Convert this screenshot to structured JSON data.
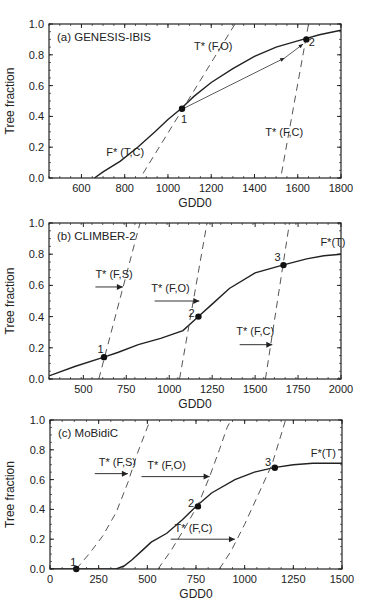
{
  "chart_data": [
    {
      "type": "line",
      "panel": "a",
      "title": "(a) GENESIS-IBIS",
      "xlabel": "GDD0",
      "ylabel": "Tree fraction",
      "xlim": [
        450,
        1800
      ],
      "ylim": [
        0.0,
        1.0
      ],
      "xticks": [
        600,
        800,
        1000,
        1200,
        1400,
        1600,
        1800
      ],
      "yticks": [
        0.0,
        0.2,
        0.4,
        0.6,
        0.8,
        1.0
      ],
      "frame": {
        "left": 49,
        "top": 24,
        "right": 341,
        "bottom": 178
      },
      "series": [
        {
          "name": "F* (T,C)",
          "style": "solid",
          "x": [
            660,
            700,
            780,
            860,
            940,
            1000,
            1060,
            1120,
            1200,
            1300,
            1400,
            1500,
            1600,
            1700,
            1800
          ],
          "y": [
            0.0,
            0.04,
            0.11,
            0.2,
            0.3,
            0.38,
            0.45,
            0.53,
            0.62,
            0.71,
            0.79,
            0.85,
            0.89,
            0.93,
            0.96
          ]
        },
        {
          "name": "T* (F,O)",
          "style": "dashed",
          "x": [
            885,
            1310
          ],
          "y": [
            0.03,
            1.0
          ]
        },
        {
          "name": "T* (F,C)",
          "style": "dashed",
          "x": [
            1525,
            1650
          ],
          "y": [
            0.03,
            1.0
          ]
        },
        {
          "name": "arrow",
          "style": "arrow",
          "x": [
            1070,
            1540
          ],
          "y": [
            0.45,
            0.78
          ]
        },
        {
          "name": "arrow2",
          "style": "arrow",
          "x": [
            1540,
            1625
          ],
          "y": [
            0.78,
            0.87
          ]
        }
      ],
      "points": [
        {
          "label": "1",
          "x": 1065,
          "y": 0.45,
          "lx": 1075,
          "ly": 0.38
        },
        {
          "label": "2",
          "x": 1640,
          "y": 0.9,
          "lx": 1665,
          "ly": 0.88
        }
      ],
      "annotations": [
        {
          "text": "T* (F,O)",
          "x": 1120,
          "y": 0.83
        },
        {
          "text": "T* (F,C)",
          "x": 1450,
          "y": 0.27
        },
        {
          "text": "F* (T,C)",
          "x": 715,
          "y": 0.14
        }
      ]
    },
    {
      "type": "line",
      "panel": "b",
      "title": "(b) CLIMBER-2",
      "xlabel": "GDD0",
      "ylabel": "Tree fraction",
      "xlim": [
        300,
        2000
      ],
      "ylim": [
        0.0,
        1.0
      ],
      "xticks": [
        500,
        750,
        1000,
        1250,
        1500,
        1750,
        2000
      ],
      "yticks": [
        0.0,
        0.2,
        0.4,
        0.6,
        0.8,
        1.0
      ],
      "frame": {
        "left": 49,
        "top": 223,
        "right": 341,
        "bottom": 379
      },
      "series": [
        {
          "name": "F*(T)",
          "style": "solid",
          "x": [
            300,
            450,
            620,
            700,
            820,
            950,
            1080,
            1170,
            1250,
            1350,
            1500,
            1660,
            1800,
            1900,
            2000
          ],
          "y": [
            0.02,
            0.08,
            0.14,
            0.17,
            0.22,
            0.26,
            0.31,
            0.4,
            0.48,
            0.58,
            0.68,
            0.73,
            0.77,
            0.79,
            0.8
          ]
        },
        {
          "name": "T* (F,S)",
          "style": "dashed",
          "x": [
            590,
            830
          ],
          "y": [
            0.0,
            1.0
          ]
        },
        {
          "name": "T* (F,O)",
          "style": "dashed",
          "x": [
            1060,
            1220
          ],
          "y": [
            0.0,
            1.0
          ]
        },
        {
          "name": "T* (F,C)",
          "style": "dashed",
          "x": [
            1560,
            1700
          ],
          "y": [
            0.0,
            1.0
          ]
        }
      ],
      "arrows": [
        {
          "x": [
            570,
            730
          ],
          "y": [
            0.59,
            0.59
          ]
        },
        {
          "x": [
            915,
            1175
          ],
          "y": [
            0.5,
            0.5
          ]
        },
        {
          "x": [
            1410,
            1600
          ],
          "y": [
            0.22,
            0.22
          ]
        }
      ],
      "points": [
        {
          "label": "1",
          "x": 620,
          "y": 0.14,
          "lx": 600,
          "ly": 0.19
        },
        {
          "label": "2",
          "x": 1170,
          "y": 0.4,
          "lx": 1130,
          "ly": 0.42
        },
        {
          "label": "3",
          "x": 1665,
          "y": 0.73,
          "lx": 1630,
          "ly": 0.78
        }
      ],
      "annotations": [
        {
          "text": "T* (F,S)",
          "x": 570,
          "y": 0.65
        },
        {
          "text": "T* (F,O)",
          "x": 895,
          "y": 0.56
        },
        {
          "text": "T* (F,C)",
          "x": 1390,
          "y": 0.28
        },
        {
          "text": "F*(T)",
          "x": 1880,
          "y": 0.85
        }
      ]
    },
    {
      "type": "line",
      "panel": "c",
      "title": "(c) MoBidiC",
      "xlabel": "GDD0",
      "ylabel": "Tree fraction",
      "xlim": [
        0,
        1500
      ],
      "ylim": [
        0.0,
        1.0
      ],
      "xticks": [
        0,
        250,
        500,
        750,
        1000,
        1250,
        1500
      ],
      "yticks": [
        0.0,
        0.2,
        0.4,
        0.6,
        0.8,
        1.0
      ],
      "frame": {
        "left": 50,
        "top": 420,
        "right": 342,
        "bottom": 569
      },
      "series": [
        {
          "name": "F*(T)",
          "style": "solid",
          "x": [
            0,
            340,
            380,
            420,
            470,
            520,
            600,
            680,
            750,
            830,
            950,
            1050,
            1150,
            1250,
            1350,
            1500
          ],
          "y": [
            0.0,
            0.0,
            0.02,
            0.06,
            0.12,
            0.18,
            0.24,
            0.33,
            0.42,
            0.51,
            0.6,
            0.65,
            0.68,
            0.7,
            0.71,
            0.71
          ]
        },
        {
          "name": "T* (F,S)",
          "style": "dashed",
          "x": [
            135,
            200,
            270,
            340,
            400,
            450,
            500,
            515
          ],
          "y": [
            0.0,
            0.1,
            0.22,
            0.38,
            0.58,
            0.78,
            0.95,
            1.0
          ]
        },
        {
          "name": "T* (F,O)",
          "style": "dashed",
          "x": [
            555,
            620,
            690,
            760,
            820,
            870,
            910,
            930
          ],
          "y": [
            0.0,
            0.12,
            0.27,
            0.43,
            0.62,
            0.8,
            0.95,
            1.0
          ]
        },
        {
          "name": "T* (F,C)",
          "style": "dashed",
          "x": [
            870,
            930,
            1000,
            1070,
            1140,
            1180,
            1210
          ],
          "y": [
            0.0,
            0.12,
            0.3,
            0.5,
            0.7,
            0.87,
            1.0
          ]
        }
      ],
      "arrows": [
        {
          "x": [
            230,
            400
          ],
          "y": [
            0.64,
            0.64
          ]
        },
        {
          "x": [
            470,
            820
          ],
          "y": [
            0.62,
            0.62
          ]
        },
        {
          "x": [
            620,
            950
          ],
          "y": [
            0.2,
            0.2
          ]
        }
      ],
      "points": [
        {
          "label": "1",
          "x": 135,
          "y": 0.0,
          "lx": 120,
          "ly": 0.05
        },
        {
          "label": "2",
          "x": 760,
          "y": 0.42,
          "lx": 725,
          "ly": 0.44
        },
        {
          "label": "3",
          "x": 1155,
          "y": 0.68,
          "lx": 1120,
          "ly": 0.72
        }
      ],
      "annotations": [
        {
          "text": "T* (F,S)",
          "x": 250,
          "y": 0.69
        },
        {
          "text": "T* (F,O)",
          "x": 500,
          "y": 0.67
        },
        {
          "text": "T* (F,C)",
          "x": 640,
          "y": 0.25
        },
        {
          "text": "F*(T)",
          "x": 1340,
          "y": 0.75
        }
      ]
    }
  ]
}
